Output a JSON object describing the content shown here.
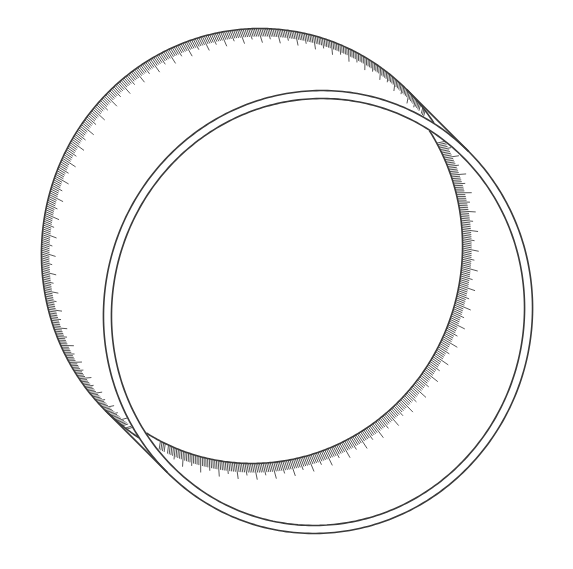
{
  "figure": {
    "style": "patent line drawing with surface shading hatches",
    "colors": {
      "background": "#ffffff",
      "line": "#3a3a3a",
      "hatch": "#555555"
    },
    "geometry": {
      "front_center": [
        318,
        312
      ],
      "front_outer_radii": [
        214,
        222
      ],
      "front_inner_radii": [
        206,
        214
      ],
      "rotation_deg": 15,
      "back_offset": [
        -62,
        -62
      ]
    }
  }
}
